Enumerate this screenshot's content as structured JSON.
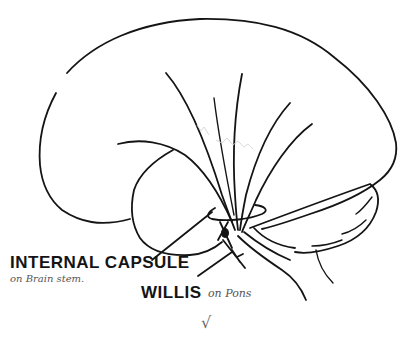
{
  "diagram": {
    "labels": {
      "internal_capsule": "INTERNAL CAPSULE",
      "internal_capsule_note": "on Brain stem.",
      "willis": "WILLIS",
      "willis_note": "on Pons",
      "check_mark": "√"
    },
    "colors": {
      "ink": "#141414",
      "pencil": "#555555",
      "background": "#ffffff"
    }
  }
}
